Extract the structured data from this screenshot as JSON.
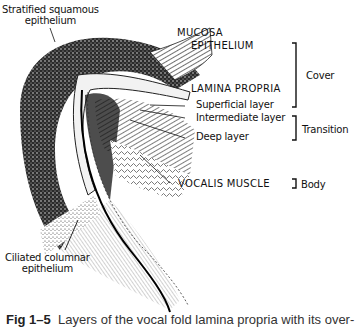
{
  "labels": {
    "stratified": [
      "Stratified squamous",
      "epithelium"
    ],
    "mucosa": "MUCOSA",
    "epithelium": "EPITHELIUM",
    "lamina_propria": "LAMINA PROPRIA",
    "superficial": "Superficial layer",
    "intermediate": "Intermediate layer",
    "deep": "Deep layer",
    "vocalis": "VOCALIS MUSCLE",
    "ciliated": [
      "Ciliated columnar",
      "epithelium"
    ]
  },
  "brackets": {
    "cover": "Cover",
    "transition": "Transition",
    "body": "Body"
  },
  "caption": {
    "number": "Fig 1–5",
    "text": "Layers of the vocal fold lamina propria with its over-"
  }
}
